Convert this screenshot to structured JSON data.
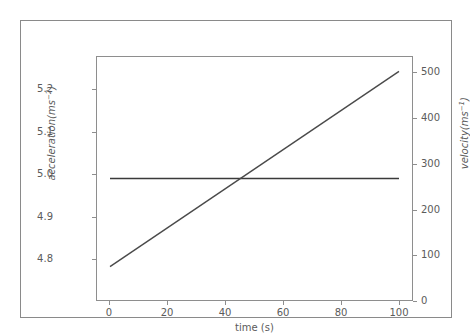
{
  "figure": {
    "clipped_top_text": "",
    "background_color": "#ffffff",
    "frame_color": "#8a8a8a",
    "axes_color": "#8e8e8e",
    "tick_label_color": "#5b5b5b"
  },
  "chart_data": {
    "type": "line",
    "title": "",
    "xlabel": "time (s)",
    "ylabel": "acceleration(ms⁻²)",
    "y2label": "velocity(ms⁻¹)",
    "grid": false,
    "legend": null,
    "xlim": [
      -4.5,
      104.5
    ],
    "ylim": [
      4.747,
      5.253
    ],
    "y2lim": [
      -27,
      533
    ],
    "xticks": [
      0,
      20,
      40,
      60,
      80,
      100
    ],
    "xticklabels": [
      "0",
      "20",
      "40",
      "60",
      "80",
      "100"
    ],
    "yticks": [
      4.8,
      4.9,
      5.0,
      5.1,
      5.2
    ],
    "yticklabels": [
      "4.8",
      "4.9",
      "5.0",
      "5.1",
      "5.2"
    ],
    "y2ticks": [
      0,
      100,
      200,
      300,
      400,
      500
    ],
    "y2ticklabels": [
      "0",
      "100",
      "200",
      "300",
      "400",
      "500"
    ],
    "series": [
      {
        "name": "acceleration",
        "axis": "left",
        "color": "#3a3a3a",
        "linewidth": 1.4,
        "x": [
          0,
          100
        ],
        "values": [
          5.0,
          5.0
        ]
      },
      {
        "name": "velocity",
        "axis": "right",
        "color": "#4a4a4a",
        "linewidth": 1.4,
        "x": [
          0,
          100
        ],
        "values": [
          50,
          500
        ]
      }
    ]
  }
}
